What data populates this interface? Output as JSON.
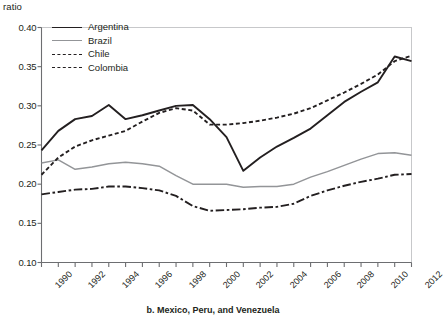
{
  "chart_data": {
    "type": "line",
    "title": "",
    "ylabel": "ratio",
    "xlabel": "",
    "ylim": [
      0.1,
      0.4
    ],
    "xlim": [
      1990,
      2012
    ],
    "grid": false,
    "legend_position": "top-left",
    "x": [
      1990,
      1991,
      1992,
      1993,
      1994,
      1995,
      1996,
      1997,
      1998,
      1999,
      2000,
      2001,
      2002,
      2003,
      2004,
      2005,
      2006,
      2007,
      2008,
      2009,
      2010,
      2011,
      2012
    ],
    "x_tick_labels": [
      "1990",
      "1992",
      "1994",
      "1996",
      "1998",
      "2000",
      "2002",
      "2004",
      "2006",
      "2008",
      "2010",
      "2012"
    ],
    "y_tick_labels": [
      "0.40",
      "0.35",
      "0.30",
      "0.25",
      "0.20",
      "0.15",
      "0.10"
    ],
    "y_ticks": [
      0.4,
      0.35,
      0.3,
      0.25,
      0.2,
      0.15,
      0.1
    ],
    "series": [
      {
        "name": "Argentina",
        "style": "solid",
        "color": "#231f20",
        "values": [
          0.243,
          0.268,
          0.283,
          0.287,
          0.301,
          0.283,
          0.288,
          0.294,
          0.3,
          0.301,
          0.283,
          0.26,
          0.217,
          0.234,
          0.248,
          0.259,
          0.271,
          0.288,
          0.305,
          0.318,
          0.33,
          0.363,
          0.357
        ]
      },
      {
        "name": "Brazil",
        "style": "solid",
        "color": "#939598",
        "values": [
          0.227,
          0.231,
          0.219,
          0.222,
          0.226,
          0.228,
          0.226,
          0.223,
          0.211,
          0.2,
          0.2,
          0.2,
          0.196,
          0.197,
          0.197,
          0.2,
          0.209,
          0.216,
          0.224,
          0.232,
          0.239,
          0.24,
          0.237
        ]
      },
      {
        "name": "Chile",
        "style": "dotted",
        "color": "#231f20",
        "values": [
          0.212,
          0.234,
          0.248,
          0.256,
          0.262,
          0.268,
          0.28,
          0.291,
          0.297,
          0.294,
          0.276,
          0.276,
          0.278,
          0.281,
          0.285,
          0.29,
          0.297,
          0.307,
          0.317,
          0.328,
          0.34,
          0.357,
          0.364
        ]
      },
      {
        "name": "Colombia",
        "style": "dash-dot",
        "color": "#231f20",
        "values": [
          0.187,
          0.19,
          0.193,
          0.194,
          0.197,
          0.197,
          0.195,
          0.192,
          0.185,
          0.172,
          0.166,
          0.167,
          0.168,
          0.17,
          0.171,
          0.175,
          0.185,
          0.192,
          0.198,
          0.203,
          0.207,
          0.212,
          0.213
        ]
      }
    ]
  },
  "legend": {
    "items": [
      {
        "label": "Argentina"
      },
      {
        "label": "Brazil"
      },
      {
        "label": "Chile"
      },
      {
        "label": "Colombia"
      }
    ]
  },
  "caption": {
    "text": "b. Mexico, Peru, and Venezuela"
  }
}
